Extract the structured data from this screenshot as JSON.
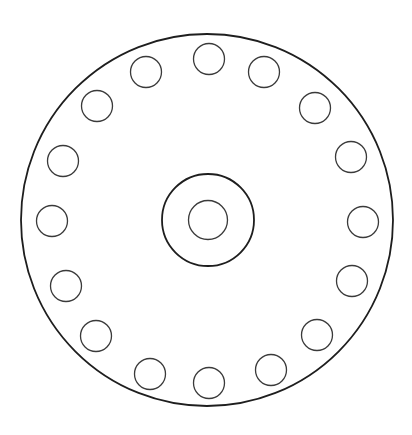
{
  "diagram": {
    "title": "",
    "canvas": {
      "width": 412,
      "height": 435,
      "background": "#ffffff"
    },
    "colors": {
      "outline": "#1e1e1e",
      "hole_outline": "#3a3a3a"
    },
    "outer_circle": {
      "cx": 207,
      "cy": 220,
      "r": 186
    },
    "hub_circle": {
      "cx": 208,
      "cy": 220,
      "r": 46
    },
    "bore_circle": {
      "cx": 208,
      "cy": 220,
      "r": 19.5
    },
    "bolt_hole_radius": 15.5,
    "bolt_holes": [
      {
        "cx": 209,
        "cy": 59
      },
      {
        "cx": 264,
        "cy": 72
      },
      {
        "cx": 315,
        "cy": 108
      },
      {
        "cx": 351,
        "cy": 157
      },
      {
        "cx": 363,
        "cy": 222
      },
      {
        "cx": 352,
        "cy": 281
      },
      {
        "cx": 317,
        "cy": 335
      },
      {
        "cx": 271,
        "cy": 370
      },
      {
        "cx": 209,
        "cy": 383
      },
      {
        "cx": 150,
        "cy": 374
      },
      {
        "cx": 96,
        "cy": 336
      },
      {
        "cx": 66,
        "cy": 286
      },
      {
        "cx": 52,
        "cy": 221
      },
      {
        "cx": 63,
        "cy": 161
      },
      {
        "cx": 97,
        "cy": 106
      },
      {
        "cx": 146,
        "cy": 72
      }
    ],
    "bolt_hole_count": 16
  }
}
